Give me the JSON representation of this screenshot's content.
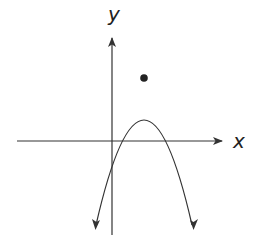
{
  "figure": {
    "type": "graph-of-parabola",
    "axes": {
      "x_label": "x",
      "y_label": "y"
    },
    "curve": {
      "shape": "parabola",
      "opens": "down",
      "passes_through_origin": true,
      "vertex_marked": true,
      "vertex_quadrant": "I",
      "color": "#333333"
    },
    "colors": {
      "line": "#333333",
      "background": "#ffffff"
    }
  }
}
